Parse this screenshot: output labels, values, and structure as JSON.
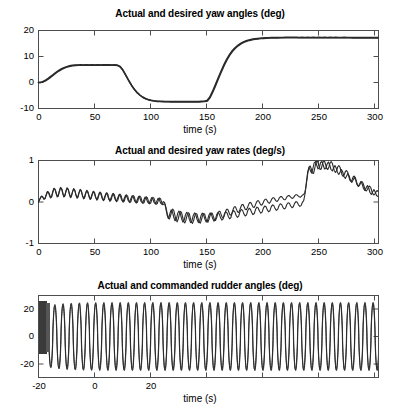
{
  "figure": {
    "background": "#ffffff",
    "line_color": "#2b2b2b",
    "axis_color": "#4d4d4d"
  },
  "chart_data": [
    {
      "type": "line",
      "title": "Actual and desired yaw angles (deg)",
      "xlabel": "time (s)",
      "ylabel": "",
      "xlim": [
        0,
        300
      ],
      "ylim": [
        -10,
        20
      ],
      "xticks": [
        0,
        50,
        100,
        150,
        200,
        250,
        300
      ],
      "yticks": [
        -10,
        0,
        10,
        20
      ],
      "xtick_labels": [
        "0",
        "50",
        "100",
        "150",
        "200",
        "250",
        "300"
      ],
      "ytick_labels": [
        "-10",
        "0",
        "10",
        "20"
      ],
      "grid": false,
      "legend": null,
      "series": [
        {
          "name": "desired yaw angle",
          "x": [
            0,
            5,
            10,
            15,
            20,
            25,
            30,
            35,
            40,
            45,
            50,
            55,
            60,
            65,
            70,
            75,
            80,
            85,
            90,
            95,
            100,
            105,
            110,
            115,
            120,
            125,
            130,
            135,
            140,
            145,
            150,
            155,
            160,
            165,
            170,
            175,
            180,
            185,
            190,
            195,
            200,
            205,
            210,
            215,
            220,
            225,
            230,
            235,
            240,
            245,
            250,
            255,
            260,
            265,
            270,
            275,
            280,
            285,
            290,
            295,
            300
          ],
          "values": [
            0,
            0.1,
            0.5,
            1.2,
            2.2,
            3.4,
            4.6,
            5.8,
            6.9,
            7.8,
            8.5,
            9.1,
            9.5,
            9.8,
            10.0,
            10.1,
            10.1,
            10.1,
            10.1,
            10.2,
            10.2,
            10.1,
            9.3,
            7.2,
            4.4,
            1.5,
            -1.2,
            -3.5,
            -5.4,
            -6.9,
            -8.0,
            -8.8,
            -9.3,
            -9.6,
            -9.8,
            -9.9,
            -9.9,
            -10.0,
            -10.0,
            -9.9,
            -9.9,
            -9.5,
            -7.5,
            -4.3,
            -0.6,
            3.2,
            6.8,
            10.0,
            12.7,
            14.9,
            16.6,
            17.8,
            18.6,
            19.1,
            19.4,
            19.6,
            19.7,
            19.8,
            19.8,
            19.8,
            19.7
          ]
        },
        {
          "name": "actual yaw angle",
          "x": [
            0,
            5,
            10,
            15,
            20,
            25,
            30,
            35,
            40,
            45,
            50,
            55,
            60,
            65,
            70,
            75,
            80,
            85,
            90,
            95,
            100,
            105,
            110,
            115,
            120,
            125,
            130,
            135,
            140,
            145,
            150,
            155,
            160,
            165,
            170,
            175,
            180,
            185,
            190,
            195,
            200,
            205,
            210,
            215,
            220,
            225,
            230,
            235,
            240,
            245,
            250,
            255,
            260,
            265,
            270,
            275,
            280,
            285,
            290,
            295,
            300
          ],
          "values": [
            0,
            0.1,
            0.45,
            1.1,
            2.1,
            3.3,
            4.5,
            5.7,
            6.8,
            7.7,
            8.4,
            9.0,
            9.4,
            9.7,
            9.9,
            10.0,
            10.0,
            10.0,
            10.0,
            10.1,
            10.1,
            10.0,
            9.2,
            7.1,
            4.3,
            1.4,
            -1.3,
            -3.6,
            -5.5,
            -7.0,
            -8.1,
            -8.9,
            -9.4,
            -9.7,
            -9.9,
            -10.0,
            -10.0,
            -10.0,
            -10.0,
            -10.0,
            -10.0,
            -9.6,
            -7.6,
            -4.4,
            -0.7,
            3.1,
            6.7,
            9.9,
            12.6,
            14.8,
            16.5,
            17.7,
            18.5,
            19.0,
            19.3,
            19.5,
            19.6,
            19.7,
            19.7,
            19.7,
            19.6
          ]
        }
      ],
      "notes": "Two nearly coincident curves: S-shaped rise to +10 deg plateau (t=45-108), descent to -10 deg plateau (t=150-205), then rise to about +19.7 deg plateau (t=270-300). Small ripples ride on plateaus."
    },
    {
      "type": "line",
      "title": "Actual and desired yaw rates (deg/s)",
      "xlabel": "time (s)",
      "ylabel": "",
      "xlim": [
        0,
        300
      ],
      "ylim": [
        -1,
        1
      ],
      "xticks": [
        0,
        50,
        100,
        150,
        200,
        250,
        300
      ],
      "yticks": [
        -1,
        0,
        1
      ],
      "xtick_labels": [
        "0",
        "50",
        "100",
        "150",
        "200",
        "250",
        "300"
      ],
      "ytick_labels": [
        "-1",
        "0",
        "1"
      ],
      "grid": false,
      "legend": null,
      "oscillation": {
        "period_s": 7.2,
        "amplitude": 0.22,
        "description": "Fast sinusoidal ripple superimposed on slow mean trend"
      },
      "series": [
        {
          "name": "mean yaw rate trend",
          "x": [
            0,
            10,
            20,
            30,
            40,
            50,
            60,
            70,
            80,
            90,
            100,
            105,
            110,
            115,
            120,
            125,
            130,
            140,
            150,
            160,
            170,
            180,
            190,
            200,
            205,
            210,
            215,
            220,
            225,
            230,
            235,
            240,
            250,
            260,
            270,
            280,
            290,
            300
          ],
          "values": [
            0.0,
            0.16,
            0.22,
            0.2,
            0.17,
            0.14,
            0.12,
            0.1,
            0.08,
            0.07,
            0.07,
            0.0,
            -0.2,
            -0.38,
            -0.45,
            -0.45,
            -0.4,
            -0.28,
            -0.16,
            -0.08,
            -0.03,
            0.0,
            0.02,
            0.05,
            0.25,
            0.55,
            0.75,
            0.78,
            0.7,
            0.55,
            0.42,
            0.32,
            0.2,
            0.12,
            0.08,
            0.05,
            0.03,
            0.02
          ]
        }
      ],
      "notes": "Ripple amplitude roughly 0.2-0.3 deg/s; peaks reach about +1.0 near t=215-225 and troughs about -0.75 near t=120-128."
    },
    {
      "type": "line",
      "title": "Actual and commanded rudder angles (deg)",
      "xlabel": "time (s)",
      "ylabel": "",
      "xlim": [
        0,
        300
      ],
      "ylim": [
        -30,
        30
      ],
      "xticks": [
        0,
        50,
        100,
        150,
        200,
        250,
        300
      ],
      "yticks": [
        -20,
        0,
        20
      ],
      "xtick_labels": [
        "-20",
        "0",
        "20"
      ],
      "ytick_labels": [
        "-20",
        "0",
        "20"
      ],
      "grid": false,
      "legend": null,
      "oscillation": {
        "period_s": 7.2,
        "amplitude": 25,
        "description": "Near-square/sinusoidal bang-bang rudder oscillation spanning about -25 to +25 deg over the whole record"
      },
      "series": [
        {
          "name": "rudder envelope",
          "x": [
            0,
            6,
            12,
            300
          ],
          "values": [
            27,
            27,
            25,
            25
          ]
        }
      ],
      "notes": "Dense dark transient band for t=0-7 s (very high frequency chatter), then steady limit-cycle oscillation at roughly 7.2 s period for the rest of the record."
    }
  ]
}
